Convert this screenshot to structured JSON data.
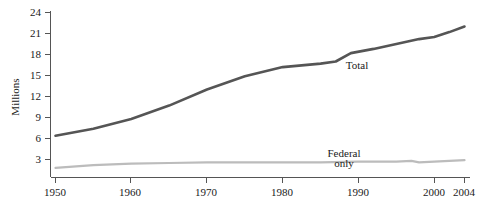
{
  "chart_data": {
    "type": "line",
    "title": "",
    "subtitle": "",
    "xlabel": "",
    "ylabel": "Millions",
    "grid": false,
    "legend_position": "inline-annotation",
    "xlim": [
      1948,
      2004
    ],
    "ylim": [
      0,
      24
    ],
    "y_ticks": [
      3,
      6,
      9,
      12,
      15,
      18,
      21,
      24
    ],
    "y_tick_labels": [
      "3",
      "6",
      "9",
      "12",
      "15",
      "18",
      "21",
      "24"
    ],
    "x_ticks": [
      1950,
      1960,
      1970,
      1980,
      1990,
      2000,
      2004
    ],
    "x_tick_labels": [
      "1950",
      "1960",
      "1970",
      "1980",
      "1990",
      "2000",
      "2004"
    ],
    "series": [
      {
        "name": "Total",
        "color": "#555555",
        "annotation": "Total",
        "x": [
          1950,
          1955,
          1960,
          1965,
          1970,
          1975,
          1980,
          1985,
          1987,
          1989,
          1992,
          1995,
          1998,
          2000,
          2002,
          2004
        ],
        "values": [
          6.4,
          7.4,
          8.8,
          10.7,
          13.0,
          14.9,
          16.2,
          16.7,
          17.0,
          18.2,
          18.8,
          19.5,
          20.2,
          20.5,
          21.2,
          22.0
        ]
      },
      {
        "name": "Federal only",
        "color": "#bcbcbc",
        "annotation_line1": "Federal",
        "annotation_line2": "only",
        "x": [
          1950,
          1955,
          1960,
          1965,
          1970,
          1975,
          1980,
          1985,
          1990,
          1995,
          1997,
          1998,
          2000,
          2002,
          2004
        ],
        "values": [
          1.8,
          2.2,
          2.4,
          2.5,
          2.6,
          2.6,
          2.6,
          2.6,
          2.7,
          2.7,
          2.8,
          2.6,
          2.7,
          2.8,
          2.9
        ]
      }
    ],
    "annotations": [
      {
        "text": "Total",
        "x": 1989,
        "y": 16.6
      },
      {
        "text": "Federal",
        "x": 1986,
        "y": 4.2
      },
      {
        "text": "only",
        "x": 1986,
        "y": 2.9
      }
    ]
  },
  "axis": {
    "y_title": "Millions"
  }
}
